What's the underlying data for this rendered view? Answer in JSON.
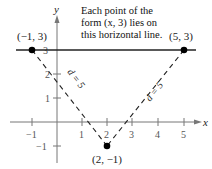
{
  "annotation": {
    "line1": "Each point of the",
    "line2": "form (x, 3) lies on",
    "line3": "this horizontal line."
  },
  "axes": {
    "x_label": "x",
    "y_label": "y",
    "x_ticks": [
      "−1",
      "1",
      "2",
      "3",
      "4",
      "5"
    ],
    "y_ticks": [
      "3",
      "2",
      "1",
      "−1"
    ]
  },
  "points": {
    "left": "(−1, 3)",
    "right": "(5, 3)",
    "bottom": "(2, −1)"
  },
  "distances": {
    "left": "d = 5",
    "right": "d = 5"
  },
  "colors": {
    "line": "#222222",
    "axis": "#777777",
    "point": "#000000"
  }
}
